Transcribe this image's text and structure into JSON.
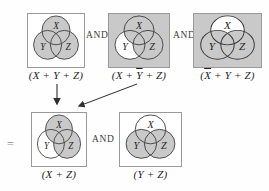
{
  "figure": {
    "equals": "=",
    "and_top_1": "AND",
    "and_top_2": "AND",
    "and_bottom": "AND"
  },
  "colors": {
    "shade": "#c9c9c9",
    "white": "#ffffff",
    "circle_stroke": "#3a3a3a",
    "box_border": "#9a9a9a",
    "label_text": "#1f1f1f",
    "operator_text": "#3d3d3d",
    "arrow": "#2f2f2f"
  },
  "circle_labels": [
    "X",
    "Y",
    "Z"
  ],
  "diagrams": [
    {
      "name": "venn-x-plus-y-plus-z",
      "background": "white",
      "fills": [
        [
          "X",
          "shade"
        ],
        [
          "Y",
          "shade"
        ],
        [
          "Z",
          "shade"
        ]
      ],
      "label_parts": [
        {
          "text": "(X + Y + Z)",
          "overline": false
        }
      ]
    },
    {
      "name": "venn-x-plus-not-y-plus-z",
      "background": "shade",
      "fills": [
        [
          "Y",
          "white"
        ],
        [
          "X",
          "shade"
        ],
        [
          "Z",
          "shade"
        ]
      ],
      "label_parts": [
        {
          "text": "(X + ",
          "overline": false
        },
        {
          "text": "Y",
          "overline": true
        },
        {
          "text": " + Z)",
          "overline": false
        }
      ]
    },
    {
      "name": "venn-not-x-plus-y-plus-z",
      "background": "shade",
      "fills": [
        [
          "X",
          "white"
        ],
        [
          "Y",
          "shade"
        ],
        [
          "Z",
          "shade"
        ]
      ],
      "label_parts": [
        {
          "text": "(",
          "overline": false
        },
        {
          "text": "X",
          "overline": true
        },
        {
          "text": " + Y + Z)",
          "overline": false
        }
      ]
    },
    {
      "name": "venn-x-plus-z",
      "background": "white",
      "fills": [
        [
          "X",
          "shade"
        ],
        [
          "Z",
          "shade"
        ]
      ],
      "label_parts": [
        {
          "text": "(X + Z)",
          "overline": false
        }
      ]
    },
    {
      "name": "venn-y-plus-z",
      "background": "white",
      "fills": [
        [
          "Y",
          "shade"
        ],
        [
          "Z",
          "shade"
        ]
      ],
      "label_parts": [
        {
          "text": "(Y + Z)",
          "overline": false
        }
      ]
    }
  ]
}
